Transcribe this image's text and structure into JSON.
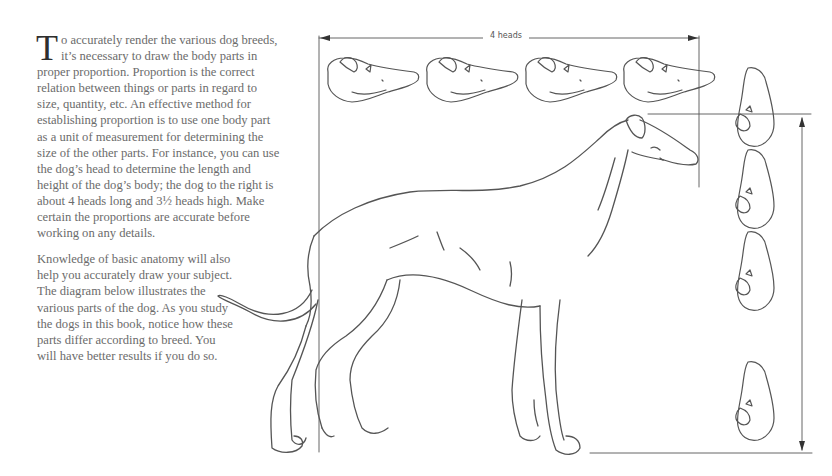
{
  "article": {
    "paragraph1": {
      "dropcap": "T",
      "text": "o accurately render the various dog breeds, it’s necessary to draw the body parts in proper proportion. Proportion is the correct relation between things or parts in regard to size, quantity, etc. An effective method for establishing proportion is to use one body part as a unit of measurement for determining the size of the other parts. For instance, you can use the dog’s head to determine the length and height of the dog’s body; the dog to the right is about 4 heads long and 3½ heads high. Make certain the proportions are accurate before working on any details."
    },
    "paragraph2": {
      "text": "Knowledge of basic anatomy will also help you accurately draw your subject. The diagram below illustrates the various parts of the dog. As you study the dogs in this book, notice how these parts differ according to breed. You will have better results if you do so."
    }
  },
  "illustration": {
    "subject": "greyhound-style dog in side profile",
    "length_label": "4 heads",
    "length_in_heads": 4,
    "height_in_heads": 3.5,
    "head_row_count": 4,
    "head_column_count": 4,
    "line_color": "#555555"
  }
}
